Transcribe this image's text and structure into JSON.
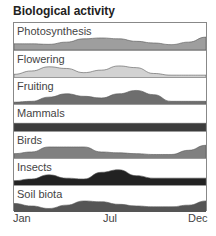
{
  "title": "Biological activity",
  "axis": {
    "labels": [
      "Jan",
      "Jul",
      "Dec"
    ]
  },
  "chart_data": {
    "type": "area",
    "title": "Biological activity",
    "xlabel": "",
    "ylabel": "",
    "x": [
      "Jan",
      "Feb",
      "Mar",
      "Apr",
      "May",
      "Jun",
      "Jul",
      "Aug",
      "Sep",
      "Oct",
      "Nov",
      "Dec"
    ],
    "tick_labels": [
      "Jan",
      "Jul",
      "Dec"
    ],
    "grid": false,
    "legend": "none (each band labeled inline)",
    "ylim": [
      0,
      1
    ],
    "series": [
      {
        "name": "Photosynthesis",
        "color": "#9e9e9e",
        "values": [
          0.25,
          0.25,
          0.22,
          0.35,
          0.55,
          0.6,
          0.55,
          0.4,
          0.3,
          0.2,
          0.35,
          0.65
        ]
      },
      {
        "name": "Flowering",
        "color": "#d2d2d2",
        "values": [
          0.1,
          0.3,
          0.55,
          0.45,
          0.2,
          0.35,
          0.6,
          0.5,
          0.15,
          0.05,
          0.05,
          0.05
        ]
      },
      {
        "name": "Fruiting",
        "color": "#6e6e6e",
        "values": [
          0.05,
          0.1,
          0.35,
          0.55,
          0.4,
          0.3,
          0.55,
          0.75,
          0.5,
          0.1,
          0.1,
          0.1
        ]
      },
      {
        "name": "Mammals",
        "color": "#3c3c3c",
        "values": [
          0.4,
          0.4,
          0.4,
          0.4,
          0.4,
          0.4,
          0.4,
          0.4,
          0.4,
          0.4,
          0.4,
          0.4
        ]
      },
      {
        "name": "Birds",
        "color": "#808080",
        "values": [
          0.2,
          0.3,
          0.6,
          0.6,
          0.6,
          0.3,
          0.25,
          0.2,
          0.15,
          0.15,
          0.4,
          0.7
        ]
      },
      {
        "name": "Insects",
        "color": "#222222",
        "values": [
          0.2,
          0.3,
          0.55,
          0.35,
          0.3,
          0.7,
          0.85,
          0.5,
          0.35,
          0.35,
          0.35,
          0.35
        ]
      },
      {
        "name": "Soil biota",
        "color": "#555555",
        "values": [
          0.45,
          0.3,
          0.15,
          0.35,
          0.6,
          0.55,
          0.4,
          0.3,
          0.25,
          0.25,
          0.35,
          0.6
        ]
      }
    ]
  }
}
